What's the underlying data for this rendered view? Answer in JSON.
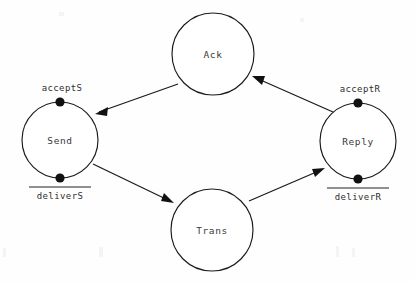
{
  "diagram": {
    "background_color": "#fefefe",
    "stroke_color": "#1a1a1a",
    "dot_color": "#111111",
    "nodes": [
      {
        "id": "ack",
        "label": "Ack",
        "cx": 213,
        "cy": 54,
        "r": 41
      },
      {
        "id": "send",
        "label": "Send",
        "cx": 60,
        "cy": 140,
        "r": 38
      },
      {
        "id": "trans",
        "label": "Trans",
        "cx": 212,
        "cy": 230,
        "r": 41
      },
      {
        "id": "reply",
        "label": "Reply",
        "cx": 358,
        "cy": 141,
        "r": 38
      }
    ],
    "ports": [
      {
        "id": "accepts",
        "label": "acceptS",
        "node": "send",
        "position": "top",
        "overline": false,
        "dot_x": 60,
        "dot_y": 102,
        "label_x": 62,
        "label_y": 88
      },
      {
        "id": "delivers",
        "label": "deliverS",
        "node": "send",
        "position": "bottom",
        "overline": true,
        "dot_x": 60,
        "dot_y": 178,
        "label_x": 60,
        "label_y": 195
      },
      {
        "id": "acceptr",
        "label": "acceptR",
        "node": "reply",
        "position": "top",
        "overline": false,
        "dot_x": 358,
        "dot_y": 103,
        "label_x": 360,
        "label_y": 89
      },
      {
        "id": "deliverr",
        "label": "deliverR",
        "node": "reply",
        "position": "bottom",
        "overline": true,
        "dot_x": 358,
        "dot_y": 179,
        "label_x": 358,
        "label_y": 196
      }
    ],
    "edges": [
      {
        "id": "ack-to-send",
        "from": "ack",
        "to": "send",
        "x1": 178,
        "y1": 84,
        "x2": 95,
        "y2": 114
      },
      {
        "id": "send-to-trans",
        "from": "send",
        "to": "trans",
        "x1": 93,
        "y1": 164,
        "x2": 174,
        "y2": 203
      },
      {
        "id": "trans-to-reply",
        "from": "trans",
        "to": "reply",
        "x1": 249,
        "y1": 201,
        "x2": 325,
        "y2": 168
      },
      {
        "id": "reply-to-ack",
        "from": "reply",
        "to": "ack",
        "x1": 333,
        "y1": 112,
        "x2": 252,
        "y2": 76
      }
    ]
  }
}
